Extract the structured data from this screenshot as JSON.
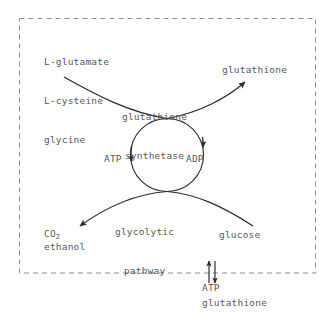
{
  "figure": {
    "type": "biochemical-pathway-diagram",
    "stroke_color": "#3a3a3a",
    "text_color": "#58585a",
    "background_color": "#ffffff",
    "boundary": {
      "style": "dashed",
      "name": "cell-membrane-boundary"
    }
  },
  "substrates": {
    "items": [
      "L-glutamate",
      "L-cysteine",
      "glycine"
    ]
  },
  "products": {
    "glutathione": "glutathione",
    "co2": "CO",
    "co2_subscript": "2",
    "ethanol": "ethanol"
  },
  "inputs": {
    "glucose": "glucose"
  },
  "enzyme": {
    "line1": "glutathione",
    "line2": "synthetase"
  },
  "pathway": {
    "line1": "glycolytic",
    "line2": "pathway"
  },
  "cofactors": {
    "atp": "ATP",
    "adp": "ADP"
  },
  "transport": {
    "atp": "ATP",
    "glutathione": "glutathione"
  }
}
